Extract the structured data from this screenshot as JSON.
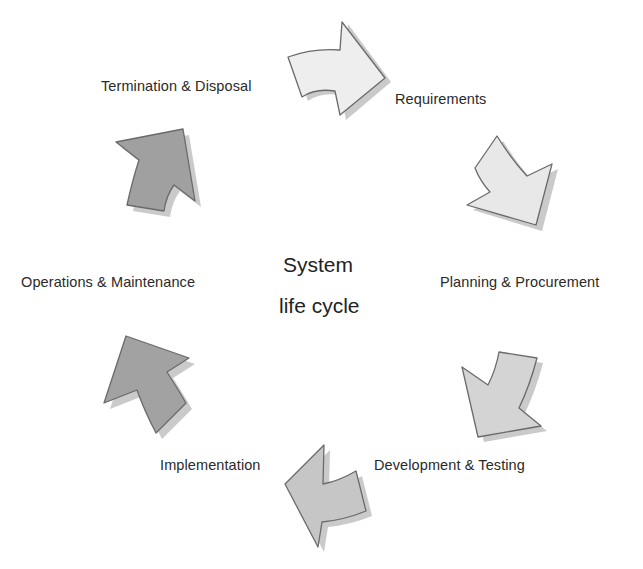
{
  "diagram": {
    "title_line1": "System",
    "title_line2": "life cycle",
    "stages": [
      {
        "label": "Requirements",
        "fill": "#eeeeee"
      },
      {
        "label": "Planning & Procurement",
        "fill": "#e6e6e6"
      },
      {
        "label": "Development & Testing",
        "fill": "#d2d2d2"
      },
      {
        "label": "Implementation",
        "fill": "#c4c4c4"
      },
      {
        "label": "Operations & Maintenance",
        "fill": "#a2a2a2"
      },
      {
        "label": "Termination & Disposal",
        "fill": "#a0a0a0"
      }
    ],
    "arrow_icons": [
      "arrow-right-icon",
      "arrow-down-right-icon",
      "arrow-down-left-icon",
      "arrow-left-icon",
      "arrow-up-left-icon",
      "arrow-up-right-icon"
    ],
    "colors": {
      "outline": "#6a6a6a",
      "shadow": "#bdbdbd",
      "text": "#2a2a2a"
    }
  }
}
